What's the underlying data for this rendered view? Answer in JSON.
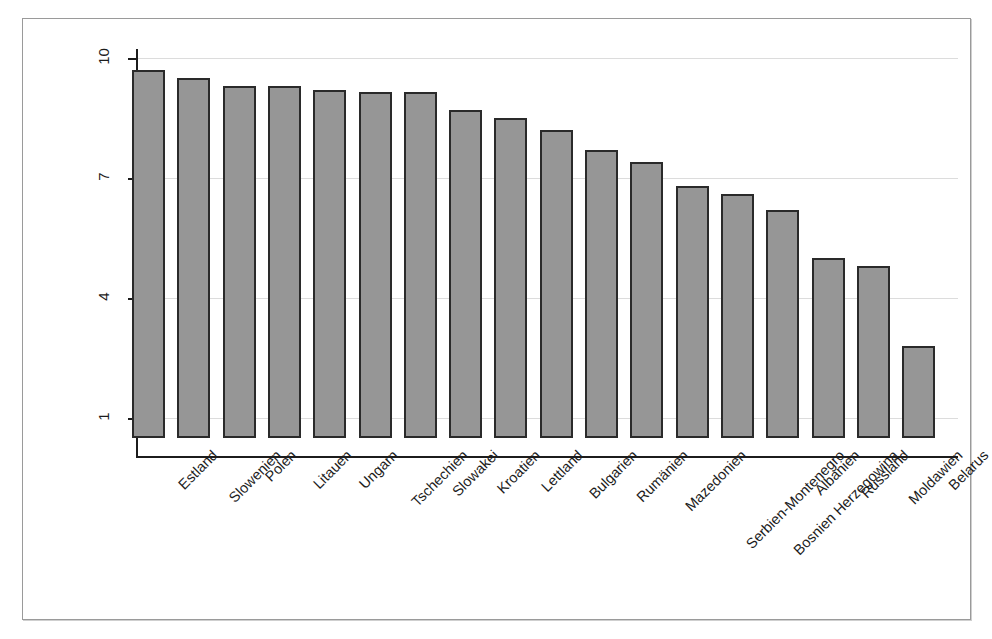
{
  "chart_data": {
    "type": "bar",
    "title": "",
    "subtitle": "",
    "xlabel": "",
    "ylabel": "",
    "grid": true,
    "legend": "none",
    "orientation": "vertical",
    "bar_color": "#969696",
    "bar_border_color": "#2a2a2a",
    "gridline_color": "#dcdcdc",
    "axis_color": "#1c1c1c",
    "ylim": [
      0.3,
      10.2
    ],
    "ytick_labels": [
      "10",
      "7",
      "4",
      "1"
    ],
    "yticks": [
      10,
      7,
      4,
      1
    ],
    "categories": [
      "Estland",
      "Slowenien",
      "Polen",
      "Litauen",
      "Ungarn",
      "Tschechien",
      "Slowakei",
      "Kroatien",
      "Lettland",
      "Bulgarien",
      "Rumänien",
      "Mazedonien",
      "Serbien-Montenegro",
      "Bosnien Herzegowina",
      "Albanien",
      "Russland",
      "Moldawien",
      "Belarus"
    ],
    "values": [
      9.7,
      9.5,
      9.3,
      9.3,
      9.2,
      9.15,
      9.15,
      8.7,
      8.5,
      8.2,
      7.7,
      7.4,
      6.8,
      6.6,
      6.2,
      5.0,
      4.8,
      2.8
    ]
  },
  "caption": {
    "cut_off_text": ""
  }
}
